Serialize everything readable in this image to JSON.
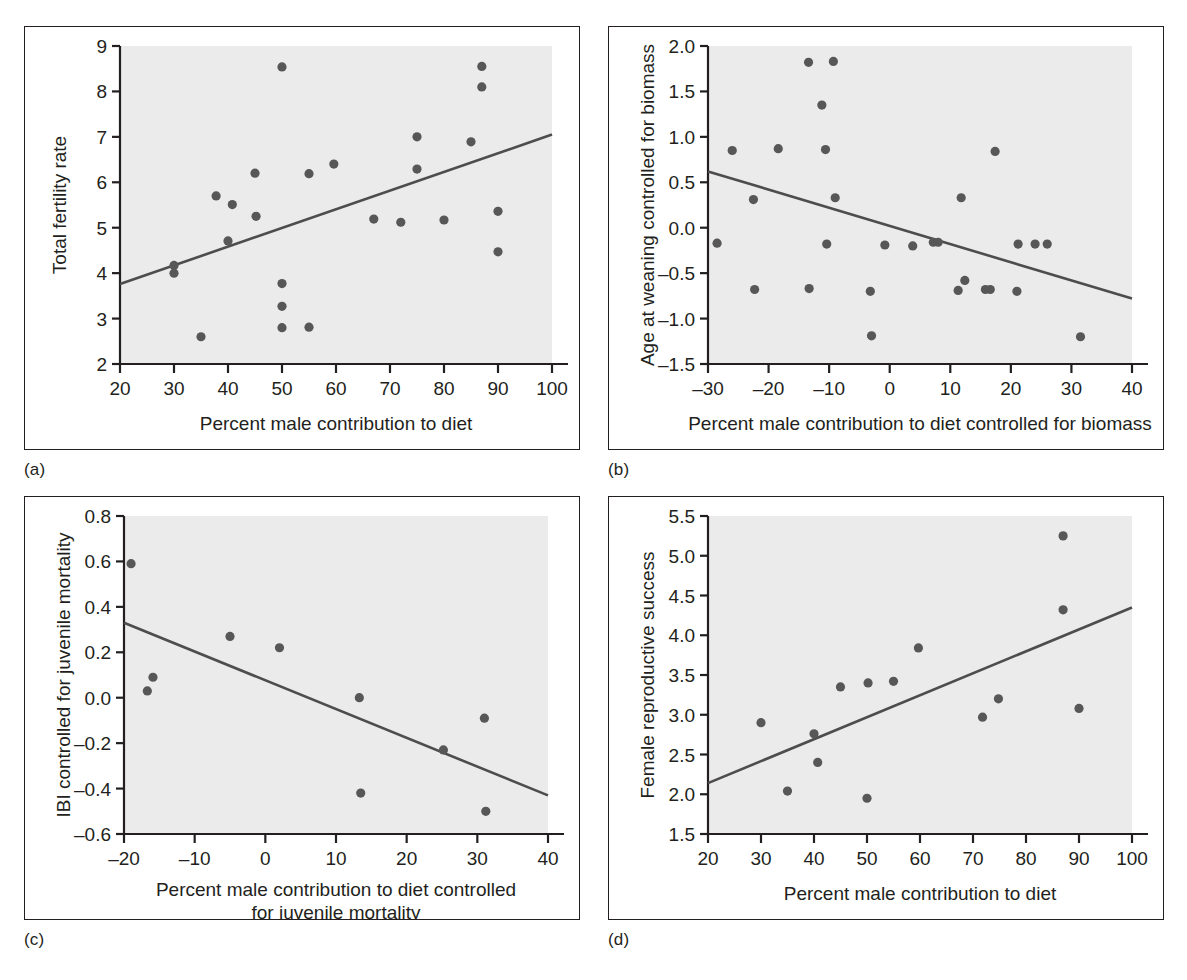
{
  "figure": {
    "background_color": "#ffffff",
    "frame_color": "#231f20",
    "plot_background_color": "#ebebeb",
    "point_color": "#575757",
    "line_color": "#4d4d4d",
    "panel_captions": [
      "(a)",
      "(b)",
      "(c)",
      "(d)"
    ]
  },
  "chart_data": [
    {
      "panel": "(a)",
      "type": "scatter",
      "title": "",
      "xlabel": "Percent male contribution to diet",
      "ylabel": "Total fertility rate",
      "xlim": [
        20,
        100
      ],
      "ylim": [
        2,
        9
      ],
      "xticks": [
        20,
        30,
        40,
        50,
        60,
        70,
        80,
        90,
        100
      ],
      "yticks": [
        2,
        3,
        4,
        5,
        6,
        7,
        8,
        9
      ],
      "xticklabels": [
        "20",
        "30",
        "40",
        "50",
        "60",
        "70",
        "80",
        "90",
        "100"
      ],
      "yticklabels": [
        "2",
        "3",
        "4",
        "5",
        "6",
        "7",
        "8",
        "9"
      ],
      "grid": false,
      "legend": "none",
      "points": [
        {
          "x": 30.0,
          "y": 4.17
        },
        {
          "x": 30.0,
          "y": 4.0
        },
        {
          "x": 35.0,
          "y": 2.6
        },
        {
          "x": 37.8,
          "y": 5.7
        },
        {
          "x": 40.0,
          "y": 4.71
        },
        {
          "x": 40.8,
          "y": 5.51
        },
        {
          "x": 45.0,
          "y": 6.2
        },
        {
          "x": 45.2,
          "y": 5.25
        },
        {
          "x": 50.0,
          "y": 8.54
        },
        {
          "x": 50.0,
          "y": 3.77
        },
        {
          "x": 50.0,
          "y": 3.27
        },
        {
          "x": 50.0,
          "y": 2.8
        },
        {
          "x": 55.0,
          "y": 6.19
        },
        {
          "x": 55.0,
          "y": 2.81
        },
        {
          "x": 59.6,
          "y": 6.4
        },
        {
          "x": 67.0,
          "y": 5.19
        },
        {
          "x": 72.0,
          "y": 5.12
        },
        {
          "x": 75.0,
          "y": 7.0
        },
        {
          "x": 75.0,
          "y": 6.29
        },
        {
          "x": 80.0,
          "y": 5.17
        },
        {
          "x": 85.0,
          "y": 6.89
        },
        {
          "x": 87.0,
          "y": 8.55
        },
        {
          "x": 87.0,
          "y": 8.1
        },
        {
          "x": 90.0,
          "y": 5.36
        },
        {
          "x": 90.0,
          "y": 4.47
        }
      ],
      "trendline": {
        "x1": 20,
        "y1": 3.76,
        "x2": 100,
        "y2": 7.05
      }
    },
    {
      "panel": "(b)",
      "type": "scatter",
      "title": "",
      "xlabel": "Percent male contribution to diet controlled for biomass",
      "ylabel": "Age at weaning controlled for biomass",
      "xlim": [
        -30,
        40
      ],
      "ylim": [
        -1.5,
        2.0
      ],
      "xticks": [
        -30,
        -20,
        -10,
        0,
        10,
        20,
        30,
        40
      ],
      "yticks": [
        -1.5,
        -1.0,
        -0.5,
        0.0,
        0.5,
        1.0,
        1.5,
        2.0
      ],
      "xticklabels": [
        "–30",
        "–20",
        "–10",
        "0",
        "10",
        "20",
        "30",
        "40"
      ],
      "yticklabels": [
        "–1.5",
        "–1.0",
        "–0.5",
        "0.0",
        "0.5",
        "1.0",
        "1.5",
        "2.0"
      ],
      "grid": false,
      "legend": "none",
      "points": [
        {
          "x": -28.5,
          "y": -0.17
        },
        {
          "x": -26.0,
          "y": 0.85
        },
        {
          "x": -22.5,
          "y": 0.31
        },
        {
          "x": -22.3,
          "y": -0.68
        },
        {
          "x": -18.4,
          "y": 0.87
        },
        {
          "x": -13.4,
          "y": 1.82
        },
        {
          "x": -13.3,
          "y": -0.67
        },
        {
          "x": -11.2,
          "y": 1.35
        },
        {
          "x": -10.6,
          "y": 0.86
        },
        {
          "x": -10.4,
          "y": -0.18
        },
        {
          "x": -9.3,
          "y": 1.83
        },
        {
          "x": -9.0,
          "y": 0.33
        },
        {
          "x": -3.2,
          "y": -0.7
        },
        {
          "x": -3.0,
          "y": -1.19
        },
        {
          "x": -0.8,
          "y": -0.19
        },
        {
          "x": 3.8,
          "y": -0.2
        },
        {
          "x": 7.2,
          "y": -0.16
        },
        {
          "x": 8.0,
          "y": -0.16
        },
        {
          "x": 11.3,
          "y": -0.69
        },
        {
          "x": 11.8,
          "y": 0.33
        },
        {
          "x": 12.4,
          "y": -0.58
        },
        {
          "x": 15.8,
          "y": -0.68
        },
        {
          "x": 16.6,
          "y": -0.68
        },
        {
          "x": 17.4,
          "y": 0.84
        },
        {
          "x": 21.0,
          "y": -0.7
        },
        {
          "x": 21.2,
          "y": -0.18
        },
        {
          "x": 24.0,
          "y": -0.18
        },
        {
          "x": 26.0,
          "y": -0.18
        },
        {
          "x": 31.5,
          "y": -1.2
        }
      ],
      "trendline": {
        "x1": -30,
        "y1": 0.62,
        "x2": 40,
        "y2": -0.78
      }
    },
    {
      "panel": "(c)",
      "type": "scatter",
      "title": "",
      "xlabel": "Percent male contribution to diet controlled\nfor juvenile mortality",
      "xlabel_line1": "Percent male contribution to diet controlled",
      "xlabel_line2": "for juvenile mortality",
      "ylabel": "IBI controlled for juvenile mortality",
      "xlim": [
        -20,
        40
      ],
      "ylim": [
        -0.6,
        0.8
      ],
      "xticks": [
        -20,
        -10,
        0,
        10,
        20,
        30,
        40
      ],
      "yticks": [
        -0.6,
        -0.4,
        -0.2,
        0.0,
        0.2,
        0.4,
        0.6,
        0.8
      ],
      "xticklabels": [
        "–20",
        "–10",
        "0",
        "10",
        "20",
        "30",
        "40"
      ],
      "yticklabels": [
        "–0.6",
        "–0.4",
        "–0.2",
        "0.0",
        "0.2",
        "0.4",
        "0.6",
        "0.8"
      ],
      "grid": false,
      "legend": "none",
      "points": [
        {
          "x": -19.0,
          "y": 0.59
        },
        {
          "x": -16.7,
          "y": 0.03
        },
        {
          "x": -15.9,
          "y": 0.09
        },
        {
          "x": -5.0,
          "y": 0.27
        },
        {
          "x": 2.0,
          "y": 0.22
        },
        {
          "x": 13.3,
          "y": 0.0
        },
        {
          "x": 13.5,
          "y": -0.42
        },
        {
          "x": 25.2,
          "y": -0.23
        },
        {
          "x": 31.0,
          "y": -0.09
        },
        {
          "x": 31.2,
          "y": -0.5
        }
      ],
      "trendline": {
        "x1": -20,
        "y1": 0.33,
        "x2": 40,
        "y2": -0.43
      }
    },
    {
      "panel": "(d)",
      "type": "scatter",
      "title": "",
      "xlabel": "Percent male contribution to diet",
      "ylabel": "Female reproductive success",
      "xlim": [
        20,
        100
      ],
      "ylim": [
        1.5,
        5.5
      ],
      "xticks": [
        20,
        30,
        40,
        50,
        60,
        70,
        80,
        90,
        100
      ],
      "yticks": [
        1.5,
        2.0,
        2.5,
        3.0,
        3.5,
        4.0,
        4.5,
        5.0,
        5.5
      ],
      "xticklabels": [
        "20",
        "30",
        "40",
        "50",
        "60",
        "70",
        "80",
        "90",
        "100"
      ],
      "yticklabels": [
        "1.5",
        "2.0",
        "2.5",
        "3.0",
        "3.5",
        "4.0",
        "4.5",
        "5.0",
        "5.5"
      ],
      "grid": false,
      "legend": "none",
      "points": [
        {
          "x": 30.0,
          "y": 2.9
        },
        {
          "x": 35.0,
          "y": 2.04
        },
        {
          "x": 40.0,
          "y": 2.76
        },
        {
          "x": 40.7,
          "y": 2.4
        },
        {
          "x": 45.0,
          "y": 3.35
        },
        {
          "x": 50.0,
          "y": 1.95
        },
        {
          "x": 50.2,
          "y": 3.4
        },
        {
          "x": 55.0,
          "y": 3.42
        },
        {
          "x": 59.7,
          "y": 3.84
        },
        {
          "x": 71.8,
          "y": 2.97
        },
        {
          "x": 74.8,
          "y": 3.2
        },
        {
          "x": 87.0,
          "y": 5.25
        },
        {
          "x": 87.0,
          "y": 4.32
        },
        {
          "x": 90.0,
          "y": 3.08
        }
      ],
      "trendline": {
        "x1": 20,
        "y1": 2.14,
        "x2": 100,
        "y2": 4.35
      }
    }
  ]
}
